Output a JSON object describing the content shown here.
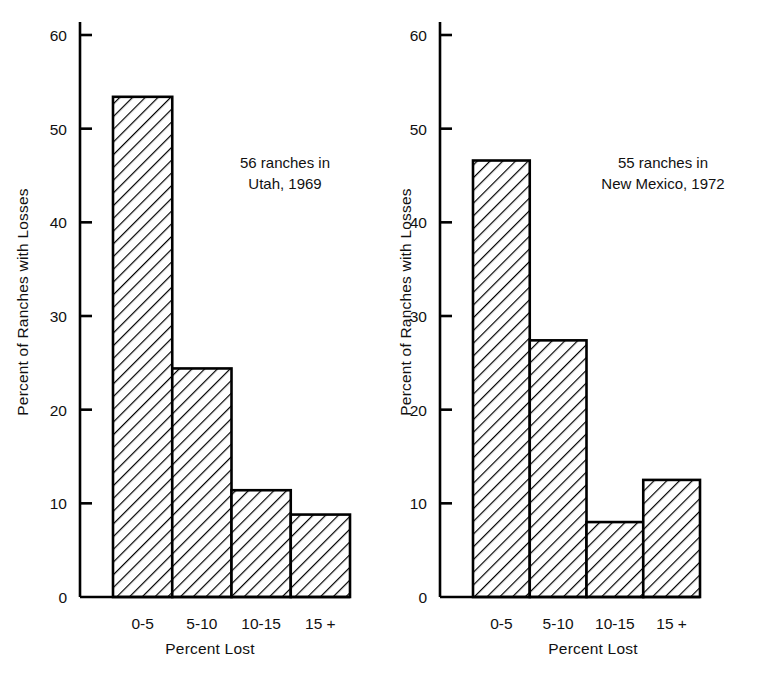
{
  "chart_data": [
    {
      "type": "bar",
      "title": "",
      "annotation": "56 ranches in\nUtah, 1969",
      "categories": [
        "0-5",
        "5-10",
        "10-15",
        "15 +"
      ],
      "values": [
        53.4,
        24.4,
        11.4,
        8.8
      ],
      "xlabel": "Percent Lost",
      "ylabel": "Percent of Ranches with Losses",
      "ylim": [
        0,
        62
      ],
      "yticks": [
        0,
        10,
        20,
        30,
        40,
        50,
        60
      ],
      "ytick_labels": [
        "0",
        "10",
        "20",
        "30",
        "40",
        "50",
        "60"
      ],
      "grid": false,
      "legend": false,
      "bar_style": "diagonal-hatch",
      "bar_edge_color": "#000000",
      "bar_fill_color": "#ffffff"
    },
    {
      "type": "bar",
      "title": "",
      "annotation": "55 ranches in\nNew Mexico, 1972",
      "categories": [
        "0-5",
        "5-10",
        "10-15",
        "15 +"
      ],
      "values": [
        46.6,
        27.4,
        8.0,
        12.5
      ],
      "xlabel": "Percent Lost",
      "ylabel": "Percent of Ranches with Losses",
      "ylim": [
        0,
        62
      ],
      "yticks": [
        0,
        10,
        20,
        30,
        40,
        50,
        60
      ],
      "ytick_labels": [
        "0",
        "10",
        "20",
        "30",
        "40",
        "50",
        "60"
      ],
      "grid": false,
      "legend": false,
      "bar_style": "diagonal-hatch",
      "bar_edge_color": "#000000",
      "bar_fill_color": "#ffffff"
    }
  ],
  "left_panel": {
    "ylabel": "Percent of Ranches with Losses",
    "xlabel": "Percent Lost",
    "annotation_line1": "56 ranches in",
    "annotation_line2": "Utah, 1969",
    "annotation": "56 ranches in\nUtah, 1969",
    "ytick_labels": [
      "60",
      "50",
      "40",
      "30",
      "20",
      "10",
      "0"
    ],
    "categories": [
      "0-5",
      "5-10",
      "10-15",
      "15 +"
    ],
    "values": [
      "53.4",
      "24.4",
      "11.4",
      "8.8"
    ]
  },
  "right_panel": {
    "ylabel": "Percent of Ranches with Losses",
    "xlabel": "Percent Lost",
    "annotation_line1": "55 ranches in",
    "annotation_line2": "New Mexico, 1972",
    "annotation": "55 ranches in\nNew Mexico, 1972",
    "ytick_labels": [
      "60",
      "50",
      "40",
      "30",
      "20",
      "10",
      "0"
    ],
    "categories": [
      "0-5",
      "5-10",
      "10-15",
      "15 +"
    ],
    "values": [
      "46.6",
      "27.4",
      "8.0",
      "12.5"
    ]
  },
  "colors": {
    "ink": "#111111",
    "axis": "#000000",
    "background": "#ffffff"
  }
}
